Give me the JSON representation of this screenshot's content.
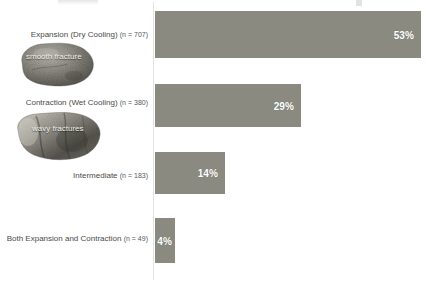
{
  "chart_data": {
    "type": "bar",
    "orientation": "horizontal",
    "title": "",
    "xlabel": "",
    "ylabel": "",
    "grid": false,
    "legend": "none",
    "xlim": [
      0,
      100
    ],
    "value_unit": "%",
    "categories": [
      "Expansion (Dry Cooling)",
      "Contraction (Wet Cooling)",
      "Intermediate",
      "Both Expansion and Contraction"
    ],
    "values": [
      53,
      29,
      14,
      4
    ],
    "value_labels": [
      "53%",
      "29%",
      "14%",
      "4%"
    ],
    "counts": [
      707,
      380,
      183,
      49
    ],
    "count_labels": [
      "(n = 707)",
      "(n = 380)",
      "(n = 183)",
      "(n = 49)"
    ],
    "bar_color": "#8a8a80",
    "value_label_color": "#ffffff",
    "category_label_color": "#4a4a48",
    "axis_color": "#e3e3e0"
  },
  "bars": [
    {
      "category": "Expansion (Dry Cooling)",
      "count_label": "(n = 707)",
      "value_label": "53%"
    },
    {
      "category": "Contraction (Wet Cooling)",
      "count_label": "(n = 380)",
      "value_label": "29%"
    },
    {
      "category": "Intermediate",
      "count_label": "(n = 183)",
      "value_label": "14%"
    },
    {
      "category": "Both Expansion and Contraction",
      "count_label": "(n = 49)",
      "value_label": "4%"
    }
  ],
  "photos": [
    {
      "caption": "smooth fracture",
      "icon": "rock-specimen-photo"
    },
    {
      "caption": "wavy fractures",
      "icon": "rock-specimen-photo"
    }
  ]
}
